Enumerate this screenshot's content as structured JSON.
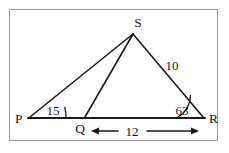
{
  "figure": {
    "background_color": "#ffffff",
    "line_color": "#1a1a1a",
    "frame_color": "#9a9a9a",
    "vertices": [
      {
        "id": "P",
        "label": "P",
        "x": 30,
        "y": 118
      },
      {
        "id": "Q",
        "label": "Q",
        "x": 85,
        "y": 118
      },
      {
        "id": "R",
        "label": "R",
        "x": 203,
        "y": 118
      },
      {
        "id": "S",
        "label": "S",
        "x": 133,
        "y": 34
      }
    ],
    "angles": [
      {
        "at": "P",
        "label": "15",
        "value": 15,
        "unit": "degrees"
      },
      {
        "at": "R",
        "label": "63",
        "value": 63,
        "unit": "degrees"
      }
    ],
    "side_labels": [
      {
        "segment": "SR",
        "label": "10",
        "value": 10
      }
    ],
    "dimensions": [
      {
        "segment": "QR",
        "label": "12",
        "value": 12,
        "arrow": "double-headed"
      }
    ]
  }
}
